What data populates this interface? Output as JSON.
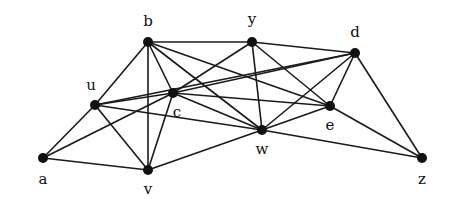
{
  "diagram": {
    "type": "undirected-graph",
    "nodes": [
      {
        "id": "b",
        "label": "b",
        "x": 148,
        "y": 42,
        "lx": 148,
        "ly": 26
      },
      {
        "id": "y",
        "label": "y",
        "x": 252,
        "y": 42,
        "lx": 252,
        "ly": 24
      },
      {
        "id": "d",
        "label": "d",
        "x": 355,
        "y": 53,
        "lx": 355,
        "ly": 37
      },
      {
        "id": "u",
        "label": "u",
        "x": 95,
        "y": 105,
        "lx": 91,
        "ly": 90
      },
      {
        "id": "c",
        "label": "c",
        "x": 173,
        "y": 93,
        "lx": 177,
        "ly": 117
      },
      {
        "id": "e",
        "label": "e",
        "x": 330,
        "y": 106,
        "lx": 330,
        "ly": 130
      },
      {
        "id": "w",
        "label": "w",
        "x": 262,
        "y": 130,
        "lx": 262,
        "ly": 154
      },
      {
        "id": "a",
        "label": "a",
        "x": 43,
        "y": 158,
        "lx": 43,
        "ly": 184
      },
      {
        "id": "v",
        "label": "v",
        "x": 148,
        "y": 170,
        "lx": 148,
        "ly": 194
      },
      {
        "id": "z",
        "label": "z",
        "x": 422,
        "y": 158,
        "lx": 422,
        "ly": 184
      }
    ],
    "edges": [
      [
        "a",
        "u"
      ],
      [
        "a",
        "c"
      ],
      [
        "a",
        "v"
      ],
      [
        "u",
        "b"
      ],
      [
        "u",
        "c"
      ],
      [
        "u",
        "v"
      ],
      [
        "u",
        "d"
      ],
      [
        "u",
        "w"
      ],
      [
        "b",
        "y"
      ],
      [
        "b",
        "c"
      ],
      [
        "b",
        "v"
      ],
      [
        "b",
        "w"
      ],
      [
        "b",
        "e"
      ],
      [
        "c",
        "y"
      ],
      [
        "c",
        "d"
      ],
      [
        "c",
        "e"
      ],
      [
        "c",
        "w"
      ],
      [
        "c",
        "v"
      ],
      [
        "y",
        "d"
      ],
      [
        "y",
        "w"
      ],
      [
        "y",
        "e"
      ],
      [
        "d",
        "w"
      ],
      [
        "d",
        "e"
      ],
      [
        "d",
        "z"
      ],
      [
        "e",
        "w"
      ],
      [
        "e",
        "z"
      ],
      [
        "w",
        "v"
      ],
      [
        "w",
        "z"
      ]
    ]
  }
}
